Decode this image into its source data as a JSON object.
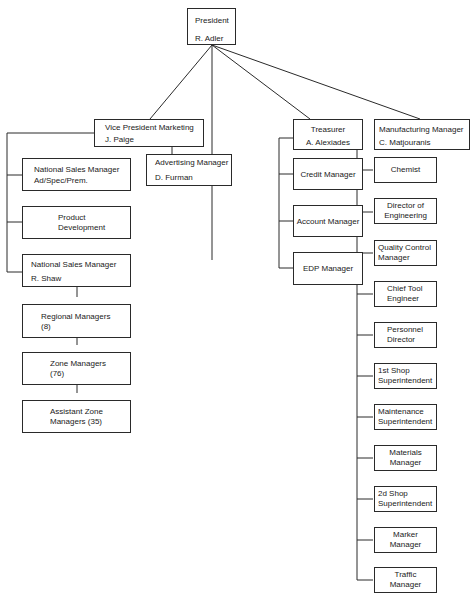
{
  "president": {
    "title": "President",
    "name": "R. Adler"
  },
  "vp_marketing": {
    "title": "Vice President Marketing",
    "name": "J. Paige"
  },
  "advertising": {
    "title": "Advertising Manager",
    "name": "D. Furman"
  },
  "treasurer": {
    "title": "Treasurer",
    "name": "A. Alexiades"
  },
  "manufacturing": {
    "title": "Manufacturing Manager",
    "name": "C. Matjouranis"
  },
  "marketing_staff": {
    "nsm_adspec": {
      "line1": "National Sales Manager",
      "line2": "Ad/Spec/Prem."
    },
    "product_dev": {
      "line1": "Product",
      "line2": "Development"
    },
    "nsm_shaw": {
      "title": "National Sales Manager",
      "name": "R. Shaw"
    },
    "regional": {
      "line1": "Regional Managers",
      "line2": "(8)"
    },
    "zone": {
      "line1": "Zone Managers",
      "line2": "(76)"
    },
    "assistant_zone": {
      "line1": "Assistant Zone",
      "line2": "Managers (35)"
    }
  },
  "treasury_staff": [
    {
      "label": "Credit Manager"
    },
    {
      "label": "Account Manager"
    },
    {
      "label": "EDP Manager"
    }
  ],
  "manufacturing_staff": [
    {
      "line1": "Chemist",
      "line2": ""
    },
    {
      "line1": "Director of",
      "line2": "Engineering"
    },
    {
      "line1": "Quality Control",
      "line2": "Manager"
    },
    {
      "line1": "Chief Tool",
      "line2": "Engineer"
    },
    {
      "line1": "Personnel",
      "line2": "Director"
    },
    {
      "line1": "1st Shop",
      "line2": "Superintendent"
    },
    {
      "line1": "Maintenance",
      "line2": "Superintendent"
    },
    {
      "line1": "Materials",
      "line2": "Manager"
    },
    {
      "line1": "2d Shop",
      "line2": "Superintendent"
    },
    {
      "line1": "Marker",
      "line2": "Manager"
    },
    {
      "line1": "Traffic",
      "line2": "Manager"
    }
  ]
}
